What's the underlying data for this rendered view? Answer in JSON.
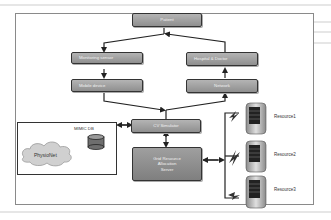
{
  "figure": {
    "nodes": {
      "patient": "Patient",
      "monitoring_sensor": "Monitoring sensor",
      "mobile_device": "Mobile device",
      "hospital_doctor": "Hospital & Doctor",
      "network": "Network",
      "cv_simulator": "CV Simulator",
      "grid_resource_line1": "Grid Resource",
      "grid_resource_line2": "Allocation",
      "grid_resource_line3": "Server"
    },
    "database": {
      "label": "MIMIC DB",
      "cloud_label": "PhysioNet"
    },
    "resources": [
      {
        "label": "Resource1"
      },
      {
        "label": "Resource2"
      },
      {
        "label": "Resource3"
      }
    ],
    "colors": {
      "box_fill": "#9e9e9e",
      "border": "#333333",
      "cloud": "#cfcfcf",
      "db": "#6e6e6e"
    }
  }
}
